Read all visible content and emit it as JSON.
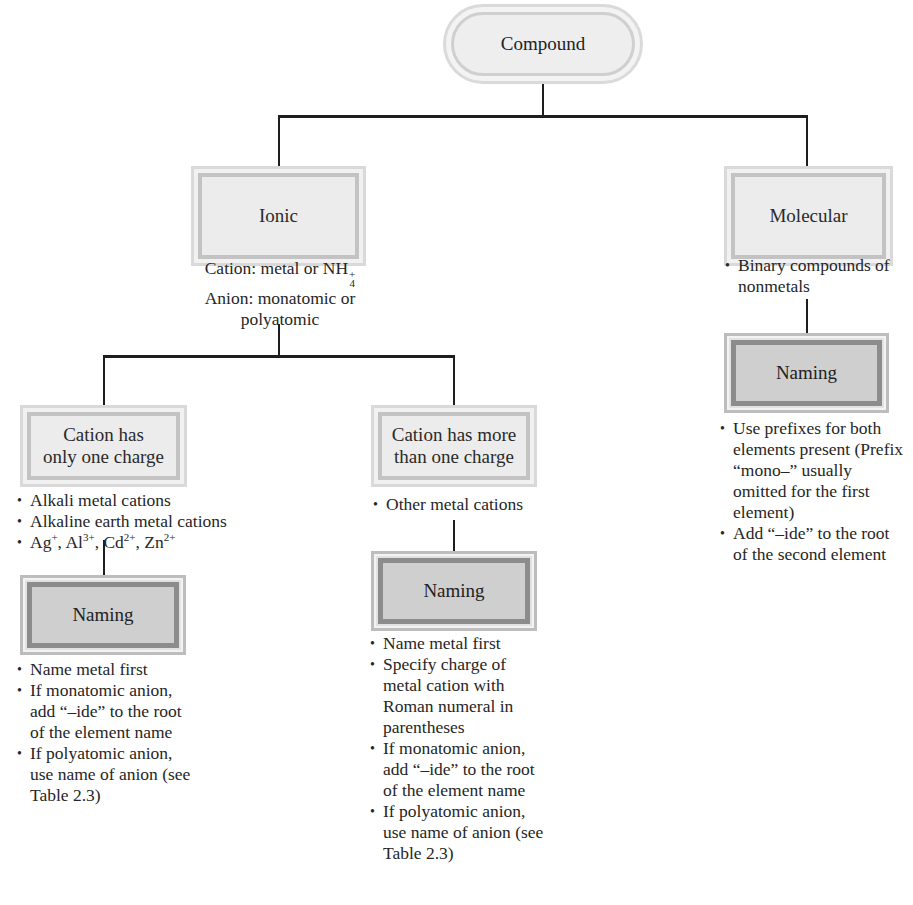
{
  "root": {
    "label": "Compound"
  },
  "ionic": {
    "label": "Ionic",
    "description": {
      "cation_prefix": "Cation: metal or NH",
      "cation_sub": "4",
      "cation_sup": "+",
      "anion_line1": "Anion: monatomic or",
      "anion_line2": "polyatomic"
    },
    "one_charge": {
      "label_line1": "Cation has",
      "label_line2": "only one charge",
      "bullets": [
        "Alkali metal cations",
        "Alkaline earth metal cations"
      ],
      "ions": [
        {
          "symbol": "Ag",
          "charge": "+"
        },
        {
          "symbol": "Al",
          "charge": "3+"
        },
        {
          "symbol": "Cd",
          "charge": "2+"
        },
        {
          "symbol": "Zn",
          "charge": "2+"
        }
      ],
      "naming": {
        "label": "Naming",
        "bullets": [
          "Name metal first",
          "If monatomic anion, add “–ide” to the root of the element name",
          "If polyatomic anion, use name of anion (see Table 2.3)"
        ]
      }
    },
    "more_charge": {
      "label_line1": "Cation has more",
      "label_line2": "than one charge",
      "bullets": [
        "Other metal cations"
      ],
      "naming": {
        "label": "Naming",
        "bullets": [
          "Name metal first",
          "Specify charge of metal cation with Roman numeral in parentheses",
          "If monatomic anion, add “–ide” to the root of the element name",
          "If polyatomic anion, use name of anion (see Table 2.3)"
        ]
      }
    }
  },
  "molecular": {
    "label": "Molecular",
    "bullets": [
      "Binary compounds of nonmetals"
    ],
    "naming": {
      "label": "Naming",
      "bullets": [
        "Use prefixes for both elements present (Prefix “mono–” usually omitted for the first element)",
        "Add “–ide” to the root of the second element"
      ]
    }
  }
}
